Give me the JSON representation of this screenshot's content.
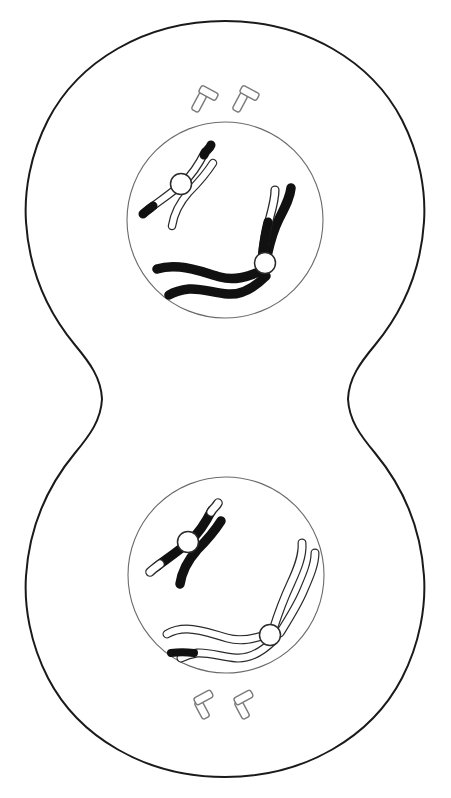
{
  "figure": {
    "title": "Telophase / Cytokinesis of Mitosis",
    "background_color": "#ffffff",
    "outline_color": "#1a1a1a",
    "chromosome_dark_color": "#111111",
    "chromosome_light_color": "#ffffff",
    "nucleus_outline_color": "#6b6b6b",
    "centriole_outline_color": "#7a7a7a"
  },
  "cell": {
    "name": "dividing-cell",
    "label": "Dividing cell with cleavage furrow",
    "outline_width": "2",
    "furrow_label": "Cleavage furrow",
    "furrow_y": 399
  },
  "daughter_cells": [
    {
      "id": "top",
      "label": "Upper daughter cell",
      "nucleus": {
        "label": "Nucleus (reforming)",
        "center_x": 225,
        "center_y": 220,
        "radius": 98
      },
      "centrioles": {
        "label": "Centriole pair",
        "count": 2,
        "position": "above nucleus"
      },
      "chromosomes": [
        {
          "label": "Metacentric chromosome (light, X-shaped)",
          "shape": "x-shaped",
          "shading": "light",
          "tips": "dark tips on upper-right and lower-left arms",
          "centromere": "white circle"
        },
        {
          "label": "Long chromosome (dark)",
          "shape": "long-bent",
          "shading": "dark",
          "tips": "light tip on one upper arm",
          "centromere": "white circle"
        }
      ]
    },
    {
      "id": "bottom",
      "label": "Lower daughter cell",
      "nucleus": {
        "label": "Nucleus (reforming)",
        "center_x": 226,
        "center_y": 575,
        "radius": 98
      },
      "centrioles": {
        "label": "Centriole pair",
        "count": 2,
        "position": "below nucleus"
      },
      "chromosomes": [
        {
          "label": "Metacentric chromosome (dark, X-shaped)",
          "shape": "x-shaped",
          "shading": "dark",
          "tips": "light tips on upper-right and lower-left arms",
          "centromere": "white circle"
        },
        {
          "label": "Long chromosome (light)",
          "shape": "long-bent",
          "shading": "light",
          "tips": "dark tip on one lower-left arm",
          "centromere": "white circle"
        }
      ]
    }
  ]
}
